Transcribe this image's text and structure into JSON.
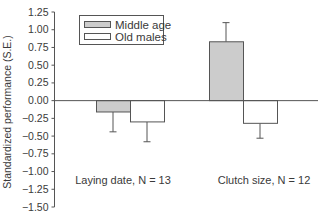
{
  "chart_data": {
    "type": "bar",
    "title": "",
    "xlabel": "",
    "ylabel": "Standardized performance (S.E.)",
    "ylim": [
      -1.5,
      1.25
    ],
    "yticks": [
      1.25,
      1.0,
      0.75,
      0.5,
      0.25,
      0.0,
      -0.25,
      -0.5,
      -0.75,
      -1.0,
      -1.25,
      -1.5
    ],
    "ytick_labels": [
      "1.25",
      "1.00",
      "0.75",
      "0.50",
      "0.25",
      "0.00",
      "−0.25",
      "−0.50",
      "−0.75",
      "−1.00",
      "−1.25",
      "−1.50"
    ],
    "categories": [
      "Laying date, N = 13",
      "Clutch size, N = 12"
    ],
    "series": [
      {
        "name": "Middle age",
        "color": "#cccccc",
        "values": [
          -0.16,
          0.83
        ],
        "errors": [
          0.28,
          0.27
        ]
      },
      {
        "name": "Old males",
        "color": "#ffffff",
        "values": [
          -0.3,
          -0.32
        ],
        "errors": [
          0.28,
          0.21
        ]
      }
    ],
    "grid": false,
    "legend_position": "upper left",
    "error_bars": "one-sided S.E. away from zero"
  },
  "legend": {
    "items": [
      {
        "label": "Middle age",
        "color": "#cccccc"
      },
      {
        "label": "Old males",
        "color": "#ffffff"
      }
    ]
  }
}
